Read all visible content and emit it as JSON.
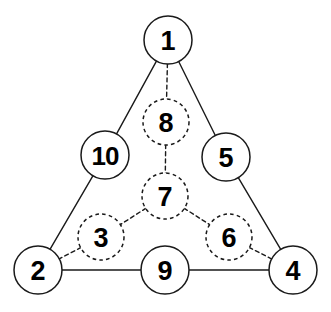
{
  "diagram": {
    "canvas": {
      "width": 331,
      "height": 312,
      "background": "#ffffff"
    },
    "stroke_color": "#1a1a1a",
    "fill_color": "#ffffff",
    "nodes": [
      {
        "id": "n1",
        "label": "1",
        "cx": 168,
        "cy": 40,
        "r": 24,
        "style": "solid",
        "role": "apex-top"
      },
      {
        "id": "n10",
        "label": "10",
        "cx": 105,
        "cy": 155,
        "r": 24,
        "style": "solid",
        "role": "edge-left"
      },
      {
        "id": "n5",
        "label": "5",
        "cx": 226,
        "cy": 157,
        "r": 24,
        "style": "solid",
        "role": "edge-right"
      },
      {
        "id": "n2",
        "label": "2",
        "cx": 38,
        "cy": 270,
        "r": 24,
        "style": "solid",
        "role": "corner-bottom-left"
      },
      {
        "id": "n9",
        "label": "9",
        "cx": 165,
        "cy": 270,
        "r": 24,
        "style": "solid",
        "role": "edge-bottom"
      },
      {
        "id": "n4",
        "label": "4",
        "cx": 293,
        "cy": 270,
        "r": 24,
        "style": "solid",
        "role": "corner-bottom-right"
      },
      {
        "id": "n8",
        "label": "8",
        "cx": 166,
        "cy": 122,
        "r": 23,
        "style": "dashed",
        "role": "interior"
      },
      {
        "id": "n7",
        "label": "7",
        "cx": 165,
        "cy": 196,
        "r": 23,
        "style": "dashed",
        "role": "interior"
      },
      {
        "id": "n3",
        "label": "3",
        "cx": 101,
        "cy": 237,
        "r": 23,
        "style": "dashed",
        "role": "interior"
      },
      {
        "id": "n6",
        "label": "6",
        "cx": 229,
        "cy": 237,
        "r": 23,
        "style": "dashed",
        "role": "interior"
      }
    ],
    "edges": [
      {
        "id": "e-1-10",
        "from": "n1",
        "to": "n10",
        "style": "solid"
      },
      {
        "id": "e-10-2",
        "from": "n10",
        "to": "n2",
        "style": "solid"
      },
      {
        "id": "e-1-5",
        "from": "n1",
        "to": "n5",
        "style": "solid"
      },
      {
        "id": "e-5-4",
        "from": "n5",
        "to": "n4",
        "style": "solid"
      },
      {
        "id": "e-2-9",
        "from": "n2",
        "to": "n9",
        "style": "solid"
      },
      {
        "id": "e-9-4",
        "from": "n9",
        "to": "n4",
        "style": "solid"
      },
      {
        "id": "e-1-8",
        "from": "n1",
        "to": "n8",
        "style": "dashed"
      },
      {
        "id": "e-8-7",
        "from": "n8",
        "to": "n7",
        "style": "dashed"
      },
      {
        "id": "e-7-3",
        "from": "n7",
        "to": "n3",
        "style": "dashed"
      },
      {
        "id": "e-3-2",
        "from": "n3",
        "to": "n2",
        "style": "dashed"
      },
      {
        "id": "e-7-6",
        "from": "n7",
        "to": "n6",
        "style": "dashed"
      },
      {
        "id": "e-6-4",
        "from": "n6",
        "to": "n4",
        "style": "dashed"
      }
    ]
  }
}
